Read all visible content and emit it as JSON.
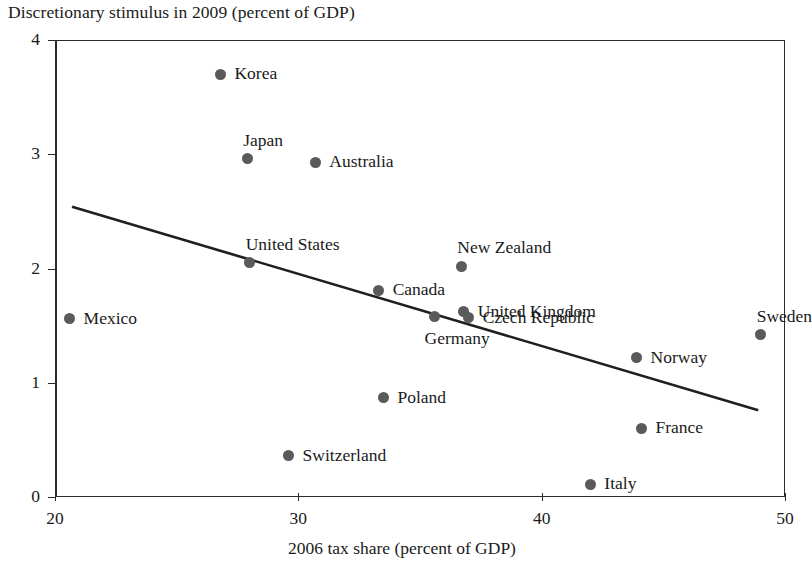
{
  "chart_data": {
    "type": "scatter",
    "title": "Discretionary stimulus in 2009 (percent of GDP)",
    "xlabel": "2006 tax share (percent of GDP)",
    "ylabel": "Discretionary stimulus in 2009 (percent of GDP)",
    "xlim": [
      20,
      50
    ],
    "ylim": [
      0,
      4
    ],
    "xticks": [
      "20",
      "30",
      "40",
      "50"
    ],
    "yticks": [
      "0",
      "1",
      "2",
      "3",
      "4"
    ],
    "grid": false,
    "legend": "none",
    "series_name": "Countries",
    "point_color": "#5a5a5a",
    "line_color": "#1f1f1f",
    "trendline": {
      "label": "fitted regression line",
      "x_start": 20.7,
      "y_start": 2.54,
      "x_end": 48.9,
      "y_end": 0.76
    },
    "points": [
      {
        "name": "Korea",
        "x": 26.8,
        "y": 3.7,
        "label_pos": "right"
      },
      {
        "name": "Japan",
        "x": 27.9,
        "y": 2.96,
        "label_pos": "above"
      },
      {
        "name": "Australia",
        "x": 30.7,
        "y": 2.93,
        "label_pos": "right"
      },
      {
        "name": "United States",
        "x": 28.0,
        "y": 2.05,
        "label_pos": "above"
      },
      {
        "name": "New Zealand",
        "x": 36.7,
        "y": 2.02,
        "label_pos": "above"
      },
      {
        "name": "Canada",
        "x": 33.3,
        "y": 1.81,
        "label_pos": "right"
      },
      {
        "name": "United Kingdom",
        "x": 36.8,
        "y": 1.62,
        "label_pos": "right"
      },
      {
        "name": "Czech Republic",
        "x": 37.0,
        "y": 1.57,
        "label_pos": "right"
      },
      {
        "name": "Germany",
        "x": 35.6,
        "y": 1.58,
        "label_pos": "below"
      },
      {
        "name": "Mexico",
        "x": 20.6,
        "y": 1.56,
        "label_pos": "right"
      },
      {
        "name": "Sweden",
        "x": 49.0,
        "y": 1.42,
        "label_pos": "above"
      },
      {
        "name": "Norway",
        "x": 43.9,
        "y": 1.22,
        "label_pos": "right"
      },
      {
        "name": "Poland",
        "x": 33.5,
        "y": 0.87,
        "label_pos": "right"
      },
      {
        "name": "France",
        "x": 44.1,
        "y": 0.6,
        "label_pos": "right"
      },
      {
        "name": "Switzerland",
        "x": 29.6,
        "y": 0.36,
        "label_pos": "right"
      },
      {
        "name": "Italy",
        "x": 42.0,
        "y": 0.11,
        "label_pos": "right"
      }
    ]
  }
}
